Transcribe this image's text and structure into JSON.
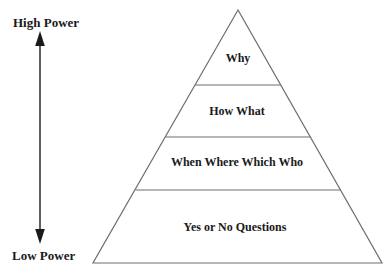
{
  "diagram": {
    "type": "pyramid",
    "side_scale": {
      "top_label": "High Power",
      "bottom_label": "Low Power",
      "arrow": "double-headed-vertical"
    },
    "pyramid_levels": [
      {
        "position": "top",
        "label": "Why"
      },
      {
        "position": "upper-middle",
        "label": "How What"
      },
      {
        "position": "lower-middle",
        "label": "When Where Which Who"
      },
      {
        "position": "bottom",
        "label": "Yes or No Questions"
      }
    ],
    "colors": {
      "background": "#ffffff",
      "outline": "#6f6f6f",
      "arrow": "#1a1a1a",
      "text": "#1a1a1a"
    }
  }
}
